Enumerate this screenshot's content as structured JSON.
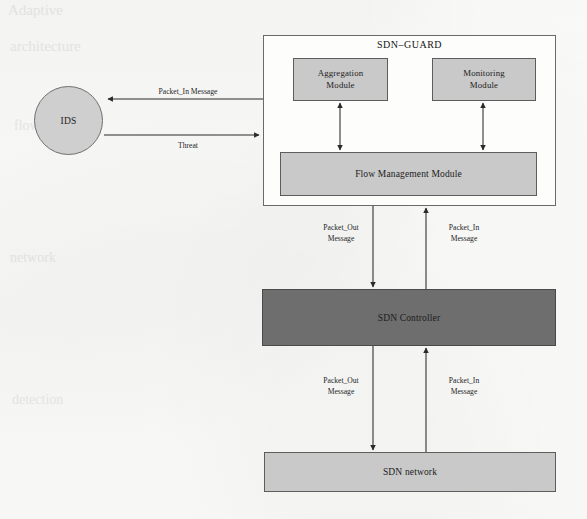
{
  "figure": {
    "kind": "block-diagram",
    "background_color": "#fbfbfa",
    "stroke_color": "#5d5d5d",
    "light_fill": "#c9c9c9",
    "dark_fill": "#6e6e6e"
  },
  "nodes": {
    "sdn_guard": {
      "label": "SDN–GUARD"
    },
    "ids": {
      "label": "IDS"
    },
    "aggregation_module": {
      "label_line1": "Aggregation",
      "label_line2": "Module"
    },
    "monitoring_module": {
      "label_line1": "Monitoring",
      "label_line2": "Module"
    },
    "flow_management_module": {
      "label": "Flow Management Module"
    },
    "sdn_controller": {
      "label": "SDN Controller"
    },
    "sdn_network": {
      "label": "SDN network"
    }
  },
  "edges": {
    "guard_to_ids": {
      "label": "Packet_In    Message"
    },
    "ids_to_guard": {
      "label": "Threat"
    },
    "guard_to_controller": {
      "line1": "Packet_Out",
      "line2": "Message"
    },
    "controller_to_guard": {
      "line1": "Packet_In",
      "line2": "Message"
    },
    "controller_to_network": {
      "line1": "Packet_Out",
      "line2": "Message"
    },
    "network_to_controller": {
      "line1": "Packet_In",
      "line2": "Message"
    }
  },
  "bleed_through": {
    "t1": "Adaptive",
    "t2": "architecture",
    "t3": "flow",
    "t4": "network",
    "t5": "detection",
    "t6": "module"
  }
}
